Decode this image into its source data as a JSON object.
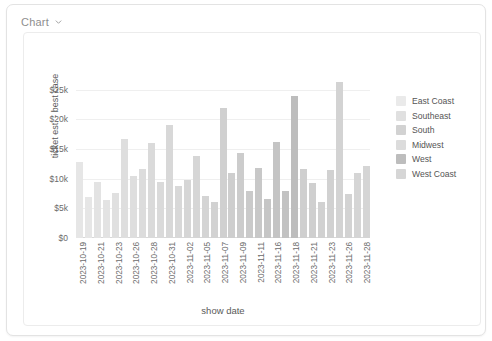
{
  "panel": {
    "title": "Chart",
    "chevron_icon": "chevron-down-icon"
  },
  "chart_data": {
    "type": "bar",
    "title": "",
    "xlabel": "show date",
    "ylabel": "ticket est. - best case",
    "ylim": [
      0,
      27000
    ],
    "grid": true,
    "legend_position": "right",
    "ytick_labels": [
      "$25k",
      "$20k",
      "$15k",
      "$10k",
      "$5k",
      "$0"
    ],
    "ytick_values": [
      25000,
      20000,
      15000,
      10000,
      5000,
      0
    ],
    "xtick_labels": [
      "2023-10-19",
      "2023-10-21",
      "2023-10-23",
      "2023-10-26",
      "2023-10-28",
      "2023-10-31",
      "2023-11-02",
      "2023-11-05",
      "2023-11-07",
      "2023-11-09",
      "2023-11-11",
      "2023-11-16",
      "2023-11-18",
      "2023-11-21",
      "2023-11-23",
      "2023-11-26",
      "2023-11-28"
    ],
    "legend": [
      {
        "name": "East Coast",
        "color": "#eaeaea"
      },
      {
        "name": "Southeast",
        "color": "#e0e0e0"
      },
      {
        "name": "South",
        "color": "#d2d2d2"
      },
      {
        "name": "Midwest",
        "color": "#dcdcdc"
      },
      {
        "name": "West",
        "color": "#bdbdbd"
      },
      {
        "name": "West Coast",
        "color": "#d6d6d6"
      }
    ],
    "categories": [
      "2023-10-19",
      "2023-10-20",
      "2023-10-21",
      "2023-10-22",
      "2023-10-23",
      "2023-10-25",
      "2023-10-26",
      "2023-10-27",
      "2023-10-28",
      "2023-10-30",
      "2023-10-31",
      "2023-11-01",
      "2023-11-02",
      "2023-11-04",
      "2023-11-05",
      "2023-11-06",
      "2023-11-07",
      "2023-11-08",
      "2023-11-09",
      "2023-11-10",
      "2023-11-11",
      "2023-11-15",
      "2023-11-16",
      "2023-11-17",
      "2023-11-18",
      "2023-11-20",
      "2023-11-21",
      "2023-11-22",
      "2023-11-23",
      "2023-11-25",
      "2023-11-26",
      "2023-11-27",
      "2023-11-28"
    ],
    "bars": [
      {
        "value": 12800,
        "color": "#e6e6e6",
        "series": "East Coast"
      },
      {
        "value": 6900,
        "color": "#e6e6e6",
        "series": "East Coast"
      },
      {
        "value": 9500,
        "color": "#e3e3e3",
        "series": "Southeast"
      },
      {
        "value": 6400,
        "color": "#e3e3e3",
        "series": "Southeast"
      },
      {
        "value": 7600,
        "color": "#e0e0e0",
        "series": "Southeast"
      },
      {
        "value": 16700,
        "color": "#dedede",
        "series": "Midwest"
      },
      {
        "value": 10400,
        "color": "#dedede",
        "series": "Midwest"
      },
      {
        "value": 11700,
        "color": "#dcdcdc",
        "series": "Midwest"
      },
      {
        "value": 16100,
        "color": "#dadada",
        "series": "South"
      },
      {
        "value": 9400,
        "color": "#dadada",
        "series": "South"
      },
      {
        "value": 19100,
        "color": "#d8d8d8",
        "series": "South"
      },
      {
        "value": 8700,
        "color": "#d8d8d8",
        "series": "South"
      },
      {
        "value": 9800,
        "color": "#d6d6d6",
        "series": "West Coast"
      },
      {
        "value": 13900,
        "color": "#d6d6d6",
        "series": "West Coast"
      },
      {
        "value": 7100,
        "color": "#d4d4d4",
        "series": "West Coast"
      },
      {
        "value": 6100,
        "color": "#d2d2d2",
        "series": "South"
      },
      {
        "value": 21900,
        "color": "#d0d0d0",
        "series": "South"
      },
      {
        "value": 11000,
        "color": "#cecece",
        "series": "South"
      },
      {
        "value": 14400,
        "color": "#cccccc",
        "series": "South"
      },
      {
        "value": 8000,
        "color": "#cacaca",
        "series": "South"
      },
      {
        "value": 11800,
        "color": "#c8c8c8",
        "series": "West"
      },
      {
        "value": 6600,
        "color": "#c6c6c6",
        "series": "West"
      },
      {
        "value": 16200,
        "color": "#c4c4c4",
        "series": "West"
      },
      {
        "value": 8000,
        "color": "#c2c2c2",
        "series": "West"
      },
      {
        "value": 24000,
        "color": "#bdbdbd",
        "series": "West"
      },
      {
        "value": 11700,
        "color": "#cfcfcf",
        "series": "West Coast"
      },
      {
        "value": 9200,
        "color": "#cfcfcf",
        "series": "West Coast"
      },
      {
        "value": 6000,
        "color": "#d1d1d1",
        "series": "West Coast"
      },
      {
        "value": 11500,
        "color": "#d1d1d1",
        "series": "West Coast"
      },
      {
        "value": 26300,
        "color": "#d3d3d3",
        "series": "West Coast"
      },
      {
        "value": 7500,
        "color": "#d3d3d3",
        "series": "West Coast"
      },
      {
        "value": 11000,
        "color": "#d5d5d5",
        "series": "West Coast"
      },
      {
        "value": 12200,
        "color": "#d5d5d5",
        "series": "West Coast"
      }
    ]
  }
}
